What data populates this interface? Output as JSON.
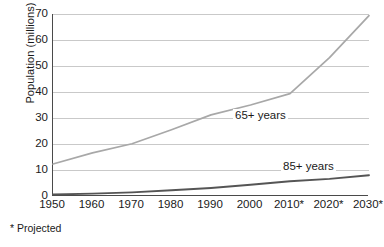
{
  "chart_data": {
    "type": "line",
    "title": "",
    "xlabel": "",
    "ylabel": "Population (millions)",
    "xlim": [
      1950,
      2030
    ],
    "ylim": [
      0,
      70
    ],
    "grid": "horizontal",
    "legend_position": "inline-annotation",
    "x": [
      1950,
      1960,
      1970,
      1980,
      1990,
      2000,
      2010,
      2020,
      2030
    ],
    "xtick_labels": [
      "1950",
      "1960",
      "1970",
      "1980",
      "1990",
      "2000",
      "2010*",
      "2020*",
      "2030*"
    ],
    "ytick_labels": [
      "70",
      "60",
      "50",
      "40",
      "30",
      "20",
      "10",
      "0"
    ],
    "ytick_values": [
      70,
      60,
      50,
      40,
      30,
      20,
      10,
      0
    ],
    "series": [
      {
        "name": "65+ years",
        "color": "#a8a8a8",
        "values": [
          12.3,
          16.6,
          20.1,
          25.5,
          31.2,
          35.0,
          39.4,
          53.2,
          69.4
        ]
      },
      {
        "name": "85+ years",
        "color": "#555555",
        "values": [
          0.6,
          0.9,
          1.4,
          2.2,
          3.1,
          4.3,
          5.7,
          6.6,
          8.0
        ]
      }
    ],
    "annotations": [
      {
        "text": "65+ years",
        "x": 2000,
        "y": 29
      },
      {
        "text": "85+ years",
        "x": 2020,
        "y": 11
      }
    ],
    "footnote": "* Projected",
    "colors": {
      "axis": "#4a4a4a",
      "gridline": "#c9c9c9",
      "series_65": "#a8a8a8",
      "series_85": "#555555",
      "text": "#1a1a1a",
      "background": "#ffffff"
    }
  },
  "axis": {
    "y_title": "Population (millions)"
  },
  "labels": {
    "series_65": "65+ years",
    "series_85": "85+ years",
    "footnote": "* Projected"
  },
  "yticks": [
    {
      "label": "70"
    },
    {
      "label": "60"
    },
    {
      "label": "50"
    },
    {
      "label": "40"
    },
    {
      "label": "30"
    },
    {
      "label": "20"
    },
    {
      "label": "10"
    },
    {
      "label": "0"
    }
  ],
  "xticks": [
    {
      "label": "1950"
    },
    {
      "label": "1960"
    },
    {
      "label": "1970"
    },
    {
      "label": "1980"
    },
    {
      "label": "1990"
    },
    {
      "label": "2000"
    },
    {
      "label": "2010*"
    },
    {
      "label": "2020*"
    },
    {
      "label": "2030*"
    }
  ]
}
